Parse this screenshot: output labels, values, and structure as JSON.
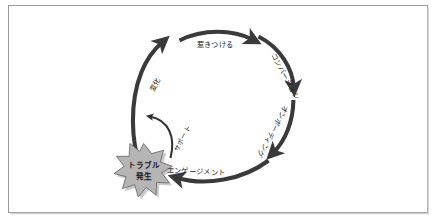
{
  "frame": {
    "border_color": "#9a9a9a",
    "background": "#ffffff",
    "shadow_color": "#cfcfcf"
  },
  "diagram": {
    "name": "customer-lifecycle-cycle",
    "arrow_color": "#3a3a3a",
    "burst_fill": "#b5b5b5",
    "burst_stroke": "#6e6e6e",
    "burst_shadow": "#c9c9c9"
  },
  "cycle": {
    "steps": [
      {
        "id": "attract",
        "label": "惹きつける",
        "rotate": 0
      },
      {
        "id": "conversion",
        "label": "コンバージョン",
        "rotate": 62
      },
      {
        "id": "onboarding",
        "label": "オンボーディング",
        "rotate": 118
      },
      {
        "id": "engagement",
        "label": "エンゲージメント",
        "rotate": 2
      },
      {
        "id": "change",
        "label": "変化",
        "rotate": -62
      }
    ]
  },
  "incident": {
    "burst_line1": "トラブル",
    "burst_line2": "発生",
    "support_label": "サポート"
  }
}
